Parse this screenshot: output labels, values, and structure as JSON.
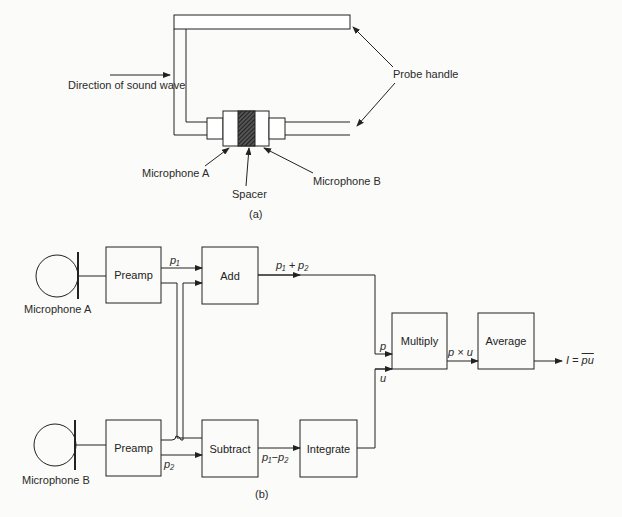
{
  "part_a": {
    "caption": "(a)",
    "labels": {
      "direction": "Direction of sound wave",
      "probe_handle": "Probe handle",
      "mic_a": "Microphone A",
      "spacer": "Spacer",
      "mic_b": "Microphone B"
    }
  },
  "part_b": {
    "caption": "(b)",
    "mic_a_label": "Microphone A",
    "mic_b_label": "Microphone B",
    "blocks": {
      "preamp_a": "Preamp",
      "preamp_b": "Preamp",
      "add": "Add",
      "subtract": "Subtract",
      "integrate": "Integrate",
      "multiply": "Multiply",
      "average": "Average"
    },
    "signals": {
      "p1": "p₁",
      "p2": "p₂",
      "sum": "p₁ + p₂",
      "diff": "p₁−p₂",
      "p": "p",
      "u": "u",
      "product": "p × u",
      "output_prefix": "I = ",
      "output_overline": "pu"
    }
  }
}
